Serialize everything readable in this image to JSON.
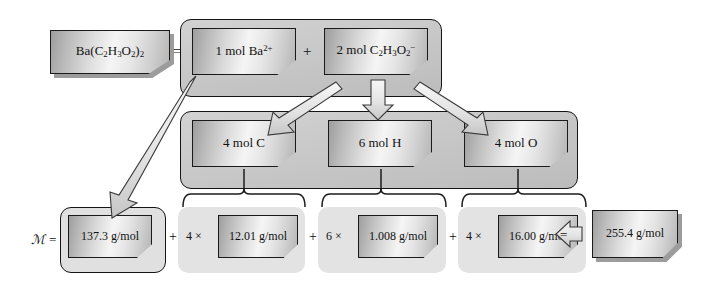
{
  "diagram": {
    "compound": {
      "formula_text": "Ba(C2H3O2)2",
      "formula_html": "Ba(C<sub>2</sub>H<sub>3</sub>O<sub>2</sub>)<sub>2</sub>"
    },
    "operators": {
      "equals_after_formula": "=",
      "plus_ions": "+",
      "molar_mass_symbol": "ℳ =",
      "plus_1": "+",
      "plus_2": "+",
      "plus_3": "+",
      "times_1": "4 ×",
      "times_2": "6 ×",
      "times_3": "4 ×",
      "equals_final": "="
    },
    "ion_row": [
      {
        "label_html": "1 mol Ba<sup>2+</sup>",
        "label_text": "1 mol Ba2+",
        "name": "barium-ion"
      },
      {
        "label_html": "2 mol C<sub>2</sub>H<sub>3</sub>O<sub>2</sub><sup>−</sup>",
        "label_text": "2 mol C2H3O2-",
        "name": "acetate-ion"
      }
    ],
    "element_row": [
      {
        "label_html": "4 mol C",
        "label_text": "4 mol C",
        "name": "carbon-moles"
      },
      {
        "label_html": "6 mol H",
        "label_text": "6 mol H",
        "name": "hydrogen-moles"
      },
      {
        "label_html": "4 mol O",
        "label_text": "4 mol O",
        "name": "oxygen-moles"
      }
    ],
    "mass_row": [
      {
        "label_html": "137.3 g/mol",
        "label_text": "137.3 g/mol",
        "name": "barium-molar-mass",
        "multiplier": ""
      },
      {
        "label_html": "12.01 g/mol",
        "label_text": "12.01 g/mol",
        "name": "carbon-molar-mass",
        "multiplier": "4 ×"
      },
      {
        "label_html": "1.008 g/mol",
        "label_text": "1.008 g/mol",
        "name": "hydrogen-molar-mass",
        "multiplier": "6 ×"
      },
      {
        "label_html": "16.00 g/mol",
        "label_text": "16.00 g/mol",
        "name": "oxygen-molar-mass",
        "multiplier": "4 ×"
      }
    ],
    "result": {
      "label_html": "255.4 g/mol",
      "label_text": "255.4 g/mol",
      "name": "total-molar-mass"
    },
    "colors": {
      "box_border": "#1a1a1a",
      "box_face_light": "#f5f5f5",
      "box_face_dark": "#9d9d9d",
      "frame_fill": "#c9c9c9",
      "group_fill": "#e3e3e3",
      "arrow_fill": "#e8e8e8",
      "arrow_stroke": "#3a3a3a",
      "text": "#111111",
      "page_background": "#ffffff"
    }
  },
  "chart_data": {
    "type": "diagram",
    "nodes": [
      {
        "id": "compound",
        "label": "Ba(C2H3O2)2",
        "level": 0
      },
      {
        "id": "ba-ion",
        "label": "1 mol Ba2+",
        "level": 1
      },
      {
        "id": "acetate-ion",
        "label": "2 mol C2H3O2-",
        "level": 1
      },
      {
        "id": "c-mol",
        "label": "4 mol C",
        "level": 2
      },
      {
        "id": "h-mol",
        "label": "6 mol H",
        "level": 2
      },
      {
        "id": "o-mol",
        "label": "4 mol O",
        "level": 2
      },
      {
        "id": "ba-mass",
        "label": "137.3 g/mol",
        "level": 3
      },
      {
        "id": "c-mass",
        "label": "12.01 g/mol",
        "level": 3
      },
      {
        "id": "h-mass",
        "label": "1.008 g/mol",
        "level": 3
      },
      {
        "id": "o-mass",
        "label": "16.00 g/mol",
        "level": 3
      },
      {
        "id": "total",
        "label": "255.4 g/mol",
        "level": 4
      }
    ],
    "edges": [
      {
        "from": "ba-ion",
        "to": "ba-mass",
        "style": "arrow"
      },
      {
        "from": "acetate-ion",
        "to": "c-mol",
        "style": "arrow"
      },
      {
        "from": "acetate-ion",
        "to": "h-mol",
        "style": "arrow"
      },
      {
        "from": "acetate-ion",
        "to": "o-mol",
        "style": "arrow"
      },
      {
        "from": "c-mol",
        "to": "c-mass",
        "style": "brace"
      },
      {
        "from": "h-mol",
        "to": "h-mass",
        "style": "brace"
      },
      {
        "from": "o-mol",
        "to": "o-mass",
        "style": "brace"
      },
      {
        "from": "o-mass",
        "to": "total",
        "style": "equals-arrow"
      }
    ],
    "equation": "137.3 + 4 x 12.01 + 6 x 1.008 + 4 x 16.00 = 255.4 g/mol",
    "terms": [
      {
        "element": "Ba",
        "count": 1,
        "atomic_mass": 137.3,
        "contribution": 137.3
      },
      {
        "element": "C",
        "count": 4,
        "atomic_mass": 12.01,
        "contribution": 48.04
      },
      {
        "element": "H",
        "count": 6,
        "atomic_mass": 1.008,
        "contribution": 6.048
      },
      {
        "element": "O",
        "count": 4,
        "atomic_mass": 16.0,
        "contribution": 64.0
      }
    ],
    "total": 255.4,
    "units": "g/mol"
  }
}
